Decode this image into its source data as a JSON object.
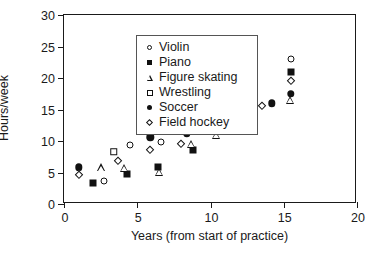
{
  "chart_data": {
    "type": "scatter",
    "title": "",
    "xlabel": "Years (from start of practice)",
    "ylabel": "Hours/week",
    "xlim": [
      0,
      20
    ],
    "ylim": [
      0,
      30
    ],
    "xticks": [
      0,
      5,
      10,
      15,
      20
    ],
    "yticks": [
      0,
      5,
      10,
      15,
      20,
      25,
      30
    ],
    "xtick_labels": [
      "0",
      "5",
      "10",
      "15",
      "20"
    ],
    "ytick_labels": [
      "0",
      "5",
      "10",
      "15",
      "20",
      "25",
      "30"
    ],
    "grid": false,
    "legend_position": "upper left",
    "series": [
      {
        "name": "Violin",
        "marker": "circle-open",
        "points": [
          [
            2.7,
            3.7
          ],
          [
            4.5,
            9.3
          ],
          [
            6.6,
            9.9
          ],
          [
            8.7,
            12.0
          ],
          [
            12.0,
            17.2
          ],
          [
            13.0,
            21.4
          ],
          [
            15.5,
            23.0
          ]
        ]
      },
      {
        "name": "Piano",
        "marker": "square-filled",
        "points": [
          [
            2.0,
            3.4
          ],
          [
            4.3,
            4.7
          ],
          [
            6.4,
            5.9
          ],
          [
            8.8,
            8.6
          ],
          [
            10.4,
            11.8
          ],
          [
            13.0,
            17.1
          ],
          [
            15.5,
            20.9
          ]
        ]
      },
      {
        "name": "Figure skating",
        "marker": "triangle-open",
        "points": [
          [
            2.5,
            5.8
          ],
          [
            4.1,
            7.0
          ],
          [
            6.5,
            7.6
          ],
          [
            8.7,
            13.3
          ],
          [
            10.4,
            16.1
          ],
          [
            13.0,
            19.2
          ],
          [
            15.4,
            24.1
          ]
        ]
      },
      {
        "name": "Wrestling",
        "marker": "square-open",
        "points": [
          [
            3.4,
            8.3
          ],
          [
            6.7,
            13.3
          ],
          [
            10.3,
            14.9
          ]
        ]
      },
      {
        "name": "Soccer",
        "marker": "circle-filled",
        "points": [
          [
            1.0,
            5.8
          ],
          [
            5.9,
            10.6
          ],
          [
            8.4,
            11.2
          ],
          [
            12.0,
            14.9
          ],
          [
            14.2,
            16.0
          ],
          [
            15.5,
            17.5
          ]
        ]
      },
      {
        "name": "Field hockey",
        "marker": "diamond-open",
        "points": [
          [
            1.0,
            4.6
          ],
          [
            3.7,
            6.8
          ],
          [
            5.9,
            8.6
          ],
          [
            8.0,
            9.6
          ],
          [
            11.6,
            14.3
          ],
          [
            13.5,
            15.5
          ],
          [
            15.5,
            19.6
          ]
        ]
      }
    ]
  }
}
